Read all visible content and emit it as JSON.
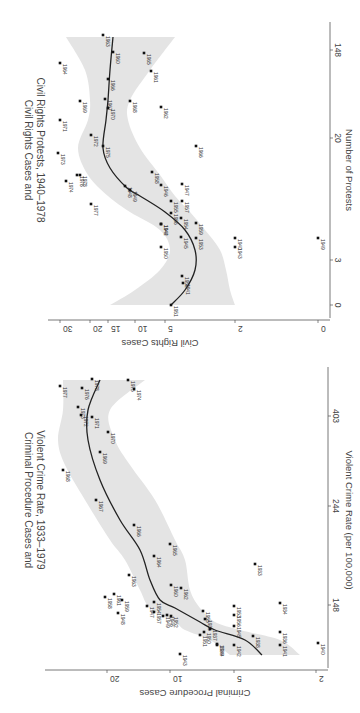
{
  "page": {
    "orientation": "rotated 90 degrees clockwise (scanned page)"
  },
  "chart_data": [
    {
      "id": "civil-rights",
      "type": "scatter",
      "title": "Civil Rights Cases and Civil Rights Protests, 1940–1978",
      "title_lines": [
        "Civil Rights Cases and",
        "Civil Rights Protests, 1940–1978"
      ],
      "xlabel": "Number of Protests",
      "ylabel": "Civil Rights Cases",
      "x_scale": "log",
      "y_scale": "log",
      "x_ticks": [
        "0",
        "3",
        "20",
        "148"
      ],
      "y_ticks": [
        "0",
        "2",
        "5",
        "10",
        "15",
        "20",
        "30"
      ],
      "has_smoother": true,
      "has_confidence_band": true,
      "grid": false,
      "legend": null,
      "points_screen": [
        {
          "label": "1963",
          "sx": 103,
          "sy": 35
        },
        {
          "label": "1960",
          "sx": 113,
          "sy": 52
        },
        {
          "label": "1965",
          "sx": 144,
          "sy": 53
        },
        {
          "label": "1964",
          "sx": 60,
          "sy": 63
        },
        {
          "label": "1961",
          "sx": 151,
          "sy": 71
        },
        {
          "label": "1966",
          "sx": 108,
          "sy": 79
        },
        {
          "label": "1969",
          "sx": 80,
          "sy": 101
        },
        {
          "label": "1967",
          "sx": 105,
          "sy": 99
        },
        {
          "label": "1968",
          "sx": 130,
          "sy": 101
        },
        {
          "label": "1970",
          "sx": 108,
          "sy": 108
        },
        {
          "label": "1962",
          "sx": 161,
          "sy": 107
        },
        {
          "label": "1971",
          "sx": 60,
          "sy": 120
        },
        {
          "label": "1972",
          "sx": 91,
          "sy": 135
        },
        {
          "label": "1975",
          "sx": 103,
          "sy": 146
        },
        {
          "label": "1966b",
          "sx": 196,
          "sy": 146
        },
        {
          "label": "1973",
          "sx": 58,
          "sy": 153
        },
        {
          "label": "1958",
          "sx": 152,
          "sy": 172
        },
        {
          "label": "1976",
          "sx": 77,
          "sy": 175
        },
        {
          "label": "1978",
          "sx": 80,
          "sy": 175
        },
        {
          "label": "1974",
          "sx": 66,
          "sy": 181
        },
        {
          "label": "1947",
          "sx": 182,
          "sy": 184
        },
        {
          "label": "1946",
          "sx": 161,
          "sy": 185
        },
        {
          "label": "1948",
          "sx": 125,
          "sy": 186
        },
        {
          "label": "1949",
          "sx": 130,
          "sy": 190
        },
        {
          "label": "1977",
          "sx": 91,
          "sy": 204
        },
        {
          "label": "1955",
          "sx": 171,
          "sy": 201
        },
        {
          "label": "1957",
          "sx": 182,
          "sy": 201
        },
        {
          "label": "1956",
          "sx": 171,
          "sy": 213
        },
        {
          "label": "1944",
          "sx": 161,
          "sy": 224
        },
        {
          "label": "1942",
          "sx": 161,
          "sy": 224
        },
        {
          "label": "1959",
          "sx": 196,
          "sy": 223
        },
        {
          "label": "1954",
          "sx": 181,
          "sy": 218
        },
        {
          "label": "1945",
          "sx": 181,
          "sy": 237
        },
        {
          "label": "1953",
          "sx": 196,
          "sy": 238
        },
        {
          "label": "1940",
          "sx": 235,
          "sy": 238
        },
        {
          "label": "1949b",
          "sx": 318,
          "sy": 238
        },
        {
          "label": "1950",
          "sx": 161,
          "sy": 247
        },
        {
          "label": "1943",
          "sx": 235,
          "sy": 247
        },
        {
          "label": "1952",
          "sx": 182,
          "sy": 276
        },
        {
          "label": "1941",
          "sx": 183,
          "sy": 283
        },
        {
          "label": "1951",
          "sx": 171,
          "sy": 305
        }
      ],
      "smoother_screen": [
        [
          171,
          305
        ],
        [
          185,
          290
        ],
        [
          195,
          270
        ],
        [
          195,
          250
        ],
        [
          185,
          230
        ],
        [
          165,
          212
        ],
        [
          140,
          196
        ],
        [
          127,
          188
        ],
        [
          110,
          168
        ],
        [
          103,
          148
        ],
        [
          106,
          120
        ],
        [
          108,
          100
        ],
        [
          110,
          70
        ],
        [
          113,
          37
        ]
      ],
      "band_upper_screen": [
        [
          110,
          305
        ],
        [
          135,
          290
        ],
        [
          160,
          270
        ],
        [
          170,
          250
        ],
        [
          160,
          230
        ],
        [
          130,
          212
        ],
        [
          108,
          196
        ],
        [
          88,
          175
        ],
        [
          78,
          148
        ],
        [
          88,
          120
        ],
        [
          90,
          100
        ],
        [
          85,
          70
        ],
        [
          66,
          37
        ]
      ],
      "band_lower_screen": [
        [
          235,
          305
        ],
        [
          230,
          290
        ],
        [
          226,
          270
        ],
        [
          220,
          250
        ],
        [
          205,
          230
        ],
        [
          190,
          212
        ],
        [
          175,
          196
        ],
        [
          160,
          175
        ],
        [
          140,
          148
        ],
        [
          128,
          120
        ],
        [
          130,
          100
        ],
        [
          150,
          70
        ],
        [
          175,
          37
        ]
      ],
      "axes_screen": {
        "y_axis_line_y": 320,
        "y_axis_x0": 48,
        "y_axis_x1": 330,
        "x_axis_line_x": 330,
        "x_axis_y0": 22,
        "x_axis_y1": 318
      },
      "y_tick_screen": [
        {
          "v": "30",
          "x": 60
        },
        {
          "v": "20",
          "x": 90
        },
        {
          "v": "15",
          "x": 108
        },
        {
          "v": "10",
          "x": 135
        },
        {
          "v": "5",
          "x": 165
        },
        {
          "v": "2",
          "x": 235
        },
        {
          "v": "0",
          "x": 318
        }
      ],
      "x_tick_screen": [
        {
          "v": "0",
          "y": 305
        },
        {
          "v": "3",
          "y": 260
        },
        {
          "v": "20",
          "y": 138
        },
        {
          "v": "148",
          "y": 50
        }
      ]
    },
    {
      "id": "criminal-procedure",
      "type": "scatter",
      "title": "Criminal Procedure Cases and Violent Crime Rate, 1933–1979",
      "title_lines": [
        "Criminal Procedure Cases and",
        "Violent Crime Rate, 1933–1979"
      ],
      "xlabel": "Violent Crime Rate (per 100,000)",
      "ylabel": "Criminal Procedure Cases",
      "x_scale": "log",
      "y_scale": "log",
      "x_ticks": [
        "148",
        "244",
        "403"
      ],
      "y_ticks": [
        "2",
        "5",
        "10",
        "20"
      ],
      "has_smoother": true,
      "has_confidence_band": true,
      "grid": false,
      "legend": null,
      "points_screen": [
        {
          "label": "1977",
          "sx": 60,
          "sy": 386
        },
        {
          "label": "1975",
          "sx": 128,
          "sy": 380
        },
        {
          "label": "1978",
          "sx": 92,
          "sy": 379
        },
        {
          "label": "1976",
          "sx": 82,
          "sy": 388
        },
        {
          "label": "1974",
          "sx": 134,
          "sy": 389
        },
        {
          "label": "1973",
          "sx": 78,
          "sy": 407
        },
        {
          "label": "1972",
          "sx": 81,
          "sy": 415
        },
        {
          "label": "1971",
          "sx": 92,
          "sy": 417
        },
        {
          "label": "1970",
          "sx": 108,
          "sy": 432
        },
        {
          "label": "1969",
          "sx": 100,
          "sy": 452
        },
        {
          "label": "1968",
          "sx": 63,
          "sy": 470
        },
        {
          "label": "1967",
          "sx": 96,
          "sy": 500
        },
        {
          "label": "1966",
          "sx": 134,
          "sy": 525
        },
        {
          "label": "1965",
          "sx": 170,
          "sy": 544
        },
        {
          "label": "1964",
          "sx": 154,
          "sy": 556
        },
        {
          "label": "1963",
          "sx": 129,
          "sy": 575
        },
        {
          "label": "1933",
          "sx": 255,
          "sy": 564
        },
        {
          "label": "1960",
          "sx": 171,
          "sy": 585
        },
        {
          "label": "1962",
          "sx": 181,
          "sy": 588
        },
        {
          "label": "1958",
          "sx": 105,
          "sy": 597
        },
        {
          "label": "1961",
          "sx": 114,
          "sy": 594
        },
        {
          "label": "1959",
          "sx": 122,
          "sy": 600
        },
        {
          "label": "1954",
          "sx": 154,
          "sy": 602
        },
        {
          "label": "1934",
          "sx": 280,
          "sy": 603
        },
        {
          "label": "1955",
          "sx": 203,
          "sy": 611
        },
        {
          "label": "1953",
          "sx": 234,
          "sy": 606
        },
        {
          "label": "1947",
          "sx": 147,
          "sy": 606
        },
        {
          "label": "1948",
          "sx": 118,
          "sy": 613
        },
        {
          "label": "1957",
          "sx": 154,
          "sy": 612
        },
        {
          "label": "1956",
          "sx": 234,
          "sy": 615
        },
        {
          "label": "1949",
          "sx": 163,
          "sy": 616
        },
        {
          "label": "1946",
          "sx": 167,
          "sy": 615
        },
        {
          "label": "1952",
          "sx": 171,
          "sy": 616
        },
        {
          "label": "1935",
          "sx": 205,
          "sy": 619
        },
        {
          "label": "1937",
          "sx": 210,
          "sy": 629
        },
        {
          "label": "1945",
          "sx": 234,
          "sy": 626
        },
        {
          "label": "1950",
          "sx": 204,
          "sy": 632
        },
        {
          "label": "1936",
          "sx": 280,
          "sy": 632
        },
        {
          "label": "1938",
          "sx": 253,
          "sy": 636
        },
        {
          "label": "1951",
          "sx": 200,
          "sy": 635
        },
        {
          "label": "1939",
          "sx": 217,
          "sy": 644
        },
        {
          "label": "1944",
          "sx": 217,
          "sy": 645
        },
        {
          "label": "1942",
          "sx": 234,
          "sy": 645
        },
        {
          "label": "1943",
          "sx": 180,
          "sy": 654
        },
        {
          "label": "1941",
          "sx": 280,
          "sy": 645
        },
        {
          "label": "1940",
          "sx": 318,
          "sy": 643
        }
      ],
      "smoother_screen": [
        [
          262,
          655
        ],
        [
          245,
          640
        ],
        [
          215,
          630
        ],
        [
          200,
          622
        ],
        [
          175,
          608
        ],
        [
          160,
          600
        ],
        [
          150,
          580
        ],
        [
          140,
          550
        ],
        [
          120,
          520
        ],
        [
          100,
          480
        ],
        [
          88,
          440
        ],
        [
          88,
          410
        ],
        [
          100,
          380
        ]
      ],
      "band_upper_screen": [
        [
          300,
          655
        ],
        [
          280,
          640
        ],
        [
          240,
          630
        ],
        [
          215,
          622
        ],
        [
          200,
          608
        ],
        [
          190,
          590
        ],
        [
          185,
          560
        ],
        [
          175,
          540
        ],
        [
          155,
          500
        ],
        [
          130,
          465
        ],
        [
          115,
          440
        ],
        [
          110,
          410
        ],
        [
          145,
          380
        ]
      ],
      "band_lower_screen": [
        [
          230,
          655
        ],
        [
          210,
          640
        ],
        [
          185,
          630
        ],
        [
          175,
          622
        ],
        [
          150,
          608
        ],
        [
          140,
          590
        ],
        [
          125,
          560
        ],
        [
          110,
          540
        ],
        [
          85,
          500
        ],
        [
          65,
          465
        ],
        [
          58,
          440
        ],
        [
          63,
          410
        ],
        [
          63,
          380
        ]
      ],
      "axes_screen": {
        "y_axis_line_y": 670,
        "y_axis_x0": 45,
        "y_axis_x1": 328,
        "x_axis_line_x": 328,
        "x_axis_y0": 367,
        "x_axis_y1": 668
      },
      "y_tick_screen": [
        {
          "v": "20",
          "x": 107
        },
        {
          "v": "10",
          "x": 170
        },
        {
          "v": "5",
          "x": 234
        },
        {
          "v": "2",
          "x": 316
        }
      ],
      "x_tick_screen": [
        {
          "v": "148",
          "y": 605
        },
        {
          "v": "244",
          "y": 506
        },
        {
          "v": "403",
          "y": 416
        }
      ]
    }
  ]
}
